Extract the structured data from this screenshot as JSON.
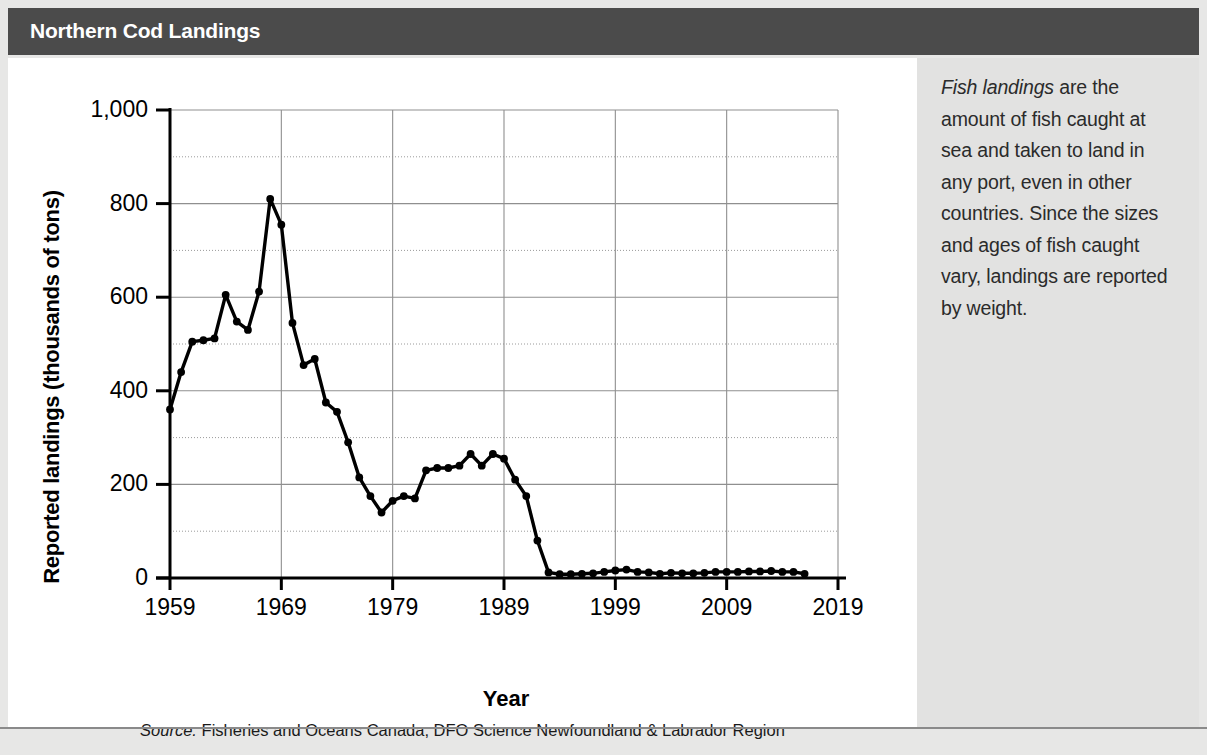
{
  "header": {
    "title": "Northern Cod Landings",
    "bar_color": "#4b4b4b",
    "text_color": "#ffffff"
  },
  "sidebar": {
    "lead_italic": "Fish landings",
    "body": " are the amount of fish caught at sea and taken to land in any port, even in other countries. Since the sizes and ages of fish caught vary, landings are reported by weight.",
    "background_color": "#e2e2e1"
  },
  "source": {
    "label": "Source:",
    "text": " Fisheries and Oceans Canada, DFO Science Newfoundland & Labrador Region"
  },
  "chart_data": {
    "type": "line",
    "title": "Northern Cod Landings",
    "xlabel": "Year",
    "ylabel": "Reported landings (thousands of tons)",
    "xlim": [
      1959,
      2019
    ],
    "ylim": [
      0,
      1000
    ],
    "xticks": [
      1959,
      1969,
      1979,
      1989,
      1999,
      2009,
      2019
    ],
    "xtick_labels": [
      "1959",
      "1969",
      "1979",
      "1989",
      "1999",
      "2009",
      "2019"
    ],
    "yticks": [
      0,
      200,
      400,
      600,
      800,
      1000
    ],
    "ytick_labels": [
      "0",
      "200",
      "400",
      "600",
      "800",
      "1,000"
    ],
    "y_minor_ticks": [
      100,
      300,
      500,
      700,
      900
    ],
    "grid": true,
    "legend": "none",
    "line_color": "#000000",
    "marker": "circle",
    "marker_color": "#000000",
    "units": "thousands of tons",
    "x": [
      1959,
      1960,
      1961,
      1962,
      1963,
      1964,
      1965,
      1966,
      1967,
      1968,
      1969,
      1970,
      1971,
      1972,
      1973,
      1974,
      1975,
      1976,
      1977,
      1978,
      1979,
      1980,
      1981,
      1982,
      1983,
      1984,
      1985,
      1986,
      1987,
      1988,
      1989,
      1990,
      1991,
      1992,
      1993,
      1994,
      1995,
      1996,
      1997,
      1998,
      1999,
      2000,
      2001,
      2002,
      2003,
      2004,
      2005,
      2006,
      2007,
      2008,
      2009,
      2010,
      2011,
      2012,
      2013,
      2014,
      2015,
      2016
    ],
    "y": [
      360,
      440,
      505,
      508,
      512,
      605,
      548,
      530,
      612,
      810,
      755,
      545,
      455,
      468,
      375,
      355,
      290,
      215,
      175,
      140,
      165,
      175,
      170,
      230,
      235,
      235,
      240,
      265,
      240,
      265,
      255,
      210,
      175,
      80,
      12,
      8,
      8,
      9,
      10,
      13,
      16,
      18,
      13,
      12,
      9,
      11,
      10,
      10,
      11,
      13,
      13,
      13,
      14,
      14,
      15,
      13,
      13,
      9
    ]
  }
}
